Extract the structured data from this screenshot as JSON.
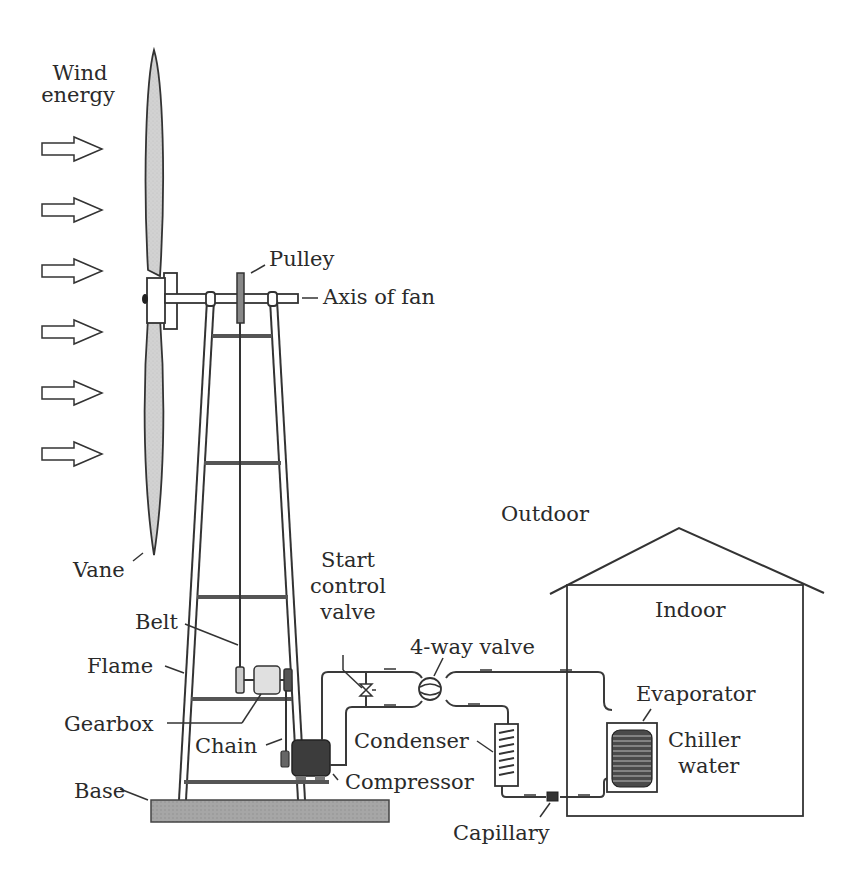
{
  "diagram": {
    "title_label": [
      "Wind",
      "energy"
    ],
    "labels": {
      "pulley": "Pulley",
      "axis_of_fan": "Axis of fan",
      "outdoor": "Outdoor",
      "vane": "Vane",
      "start_control_valve": [
        "Start",
        "control",
        "valve"
      ],
      "indoor": "Indoor",
      "belt": "Belt",
      "four_way_valve": "4-way valve",
      "flame": "Flame",
      "evaporator": "Evaporator",
      "gearbox": "Gearbox",
      "chiller_water": [
        "Chiller",
        "water"
      ],
      "chain": "Chain",
      "condenser": "Condenser",
      "compressor": "Compressor",
      "base": "Base",
      "capillary": "Capillary"
    },
    "wind_arrow_count": 6,
    "colors": {
      "line": "#333333",
      "blade_fill": "#d4d4d4",
      "base_fill": "#a8a8a8",
      "compressor_fill": "#3c3c3c",
      "gearbox_fill": "#e0e0e0"
    }
  }
}
